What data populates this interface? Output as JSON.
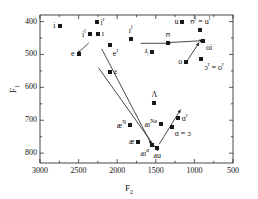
{
  "chart_data": {
    "type": "scatter",
    "title": "",
    "xlabel": "F2",
    "ylabel": "F1",
    "xlim": [
      3000,
      500
    ],
    "ylim": [
      380,
      830
    ],
    "x_inverted": true,
    "y_inverted": true,
    "grid": false,
    "legend": "none",
    "xticks": [
      3000,
      2500,
      2000,
      1500,
      1000,
      500
    ],
    "xtick_labels": [
      "3000",
      "2500",
      "2000",
      "1500",
      "1000",
      "500"
    ],
    "yticks": [
      400,
      500,
      600,
      700,
      800
    ],
    "ytick_labels": [
      "400",
      "500",
      "600",
      "700",
      "800"
    ],
    "x_minor_ticks": [
      2750,
      2250,
      1750,
      1250,
      750
    ],
    "y_minor_ticks": [
      450,
      550,
      650,
      750
    ],
    "marker_style": "filled-square",
    "marker_color": "#1a1a1a",
    "points": [
      {
        "label": "i",
        "label_html": "i",
        "F2": 2747,
        "F1": 412,
        "label_pos": "left"
      },
      {
        "label": "i^r",
        "label_html": "i<sup>r</sup>",
        "F2": 2267,
        "F1": 400,
        "label_pos": "right"
      },
      {
        "label": "i^l",
        "label_html": "i<sup>l</sup>",
        "F2": 2356,
        "F1": 438,
        "label_pos": "left"
      },
      {
        "label": "I",
        "label_html": "&#618;",
        "F2": 2253,
        "F1": 438,
        "label_pos": "right"
      },
      {
        "label": "e^r",
        "label_html": "e<sup>r</sup>",
        "F2": 2095,
        "F1": 470,
        "label_pos": "below-right"
      },
      {
        "label": "e",
        "label_html": "e",
        "F2": 2500,
        "F1": 500,
        "label_pos": "left"
      },
      {
        "label": "E",
        "label_html": "&#603;",
        "F2": 2094,
        "F1": 552,
        "label_pos": "right"
      },
      {
        "label": "I^l",
        "label_html": "&#618;<sup>l</sup>",
        "F2": 1825,
        "F1": 454,
        "label_pos": "above"
      },
      {
        "label": "r",
        "label_html": "&#633;<sub>&#448;</sub>",
        "F2": 1544,
        "F1": 491,
        "label_pos": "left"
      },
      {
        "label": "U",
        "label_html": "&#650;",
        "F2": 1343,
        "F1": 464,
        "label_pos": "above"
      },
      {
        "label": "u",
        "label_html": "u",
        "F2": 1155,
        "F1": 400,
        "label_pos": "left"
      },
      {
        "label": "U^l = u^l",
        "label_html": "&#650;<sup>l</sup> = u<sup>l</sup>",
        "F2": 924,
        "F1": 427,
        "label_pos": "above"
      },
      {
        "label": "oi",
        "label_html": "oi",
        "F2": 890,
        "F1": 458,
        "label_pos": "below-right"
      },
      {
        "label": "o",
        "label_html": "o",
        "F2": 1104,
        "F1": 523,
        "label_pos": "left"
      },
      {
        "label": "O^r = o^r",
        "label_html": "&#596;<sup>r</sup> = o<sup>r</sup>",
        "F2": 912,
        "F1": 513,
        "label_pos": "below-right"
      },
      {
        "label": "V",
        "label_html": "&#923;",
        "F2": 1518,
        "F1": 648,
        "label_pos": "above"
      },
      {
        "label": "ae^N",
        "label_html": "&#230;<sup>N</sup>",
        "F2": 1832,
        "F1": 714,
        "label_pos": "left"
      },
      {
        "label": "ae",
        "label_html": "&#230;",
        "F2": 1726,
        "F1": 765,
        "label_pos": "left"
      },
      {
        "label": "ai^N0",
        "label_html": "a&#618;<sup>N&#248;</sup>",
        "F2": 1432,
        "F1": 711,
        "label_pos": "left"
      },
      {
        "label": "ai^0",
        "label_html": "a&#618;<sup>&#248;</sup>",
        "F2": 1549,
        "F1": 774,
        "label_pos": "below-left"
      },
      {
        "label": "au",
        "label_html": "au",
        "F2": 1481,
        "F1": 783,
        "label_pos": "below"
      },
      {
        "label": "A^r",
        "label_html": "&#593;<sup>r</sup>",
        "F2": 1215,
        "F1": 693,
        "label_pos": "right"
      },
      {
        "label": "A = O",
        "label_html": "&#593; = &#596;",
        "F2": 1295,
        "F1": 721,
        "label_pos": "below-right"
      }
    ],
    "arrows": [
      {
        "name": "e-arrow",
        "from": {
          "F2": 2369,
          "F1": 465
        },
        "to": {
          "F2": 2513,
          "F1": 497
        }
      },
      {
        "name": "E-to-ai-arrow",
        "from": {
          "F2": 2200,
          "F1": 483
        },
        "to": {
          "F2": 1557,
          "F1": 773
        }
      },
      {
        "name": "eps-long-arrow",
        "from": {
          "F2": 2244,
          "F1": 540
        },
        "to": {
          "F2": 1475,
          "F1": 793
        }
      },
      {
        "name": "r-arrow",
        "from": {
          "F2": 1696,
          "F1": 466
        },
        "to": {
          "F2": 1312,
          "F1": 466
        }
      },
      {
        "name": "U-oi-arrow",
        "from": {
          "F2": 1343,
          "F1": 464
        },
        "to": {
          "F2": 890,
          "F1": 458
        }
      },
      {
        "name": "o-to-Or-arrow",
        "from": {
          "F2": 1104,
          "F1": 523
        },
        "to": {
          "F2": 940,
          "F1": 464
        }
      },
      {
        "name": "aiN0-Ar-arrow",
        "from": {
          "F2": 1456,
          "F1": 773
        },
        "to": {
          "F2": 1180,
          "F1": 668
        }
      }
    ]
  }
}
